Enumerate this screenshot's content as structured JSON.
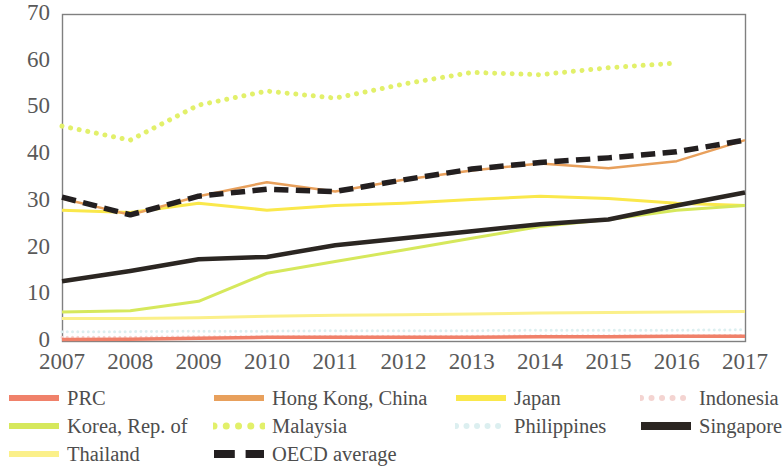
{
  "chart_data": {
    "type": "line",
    "title": "",
    "subtitle": "",
    "xlabel": "",
    "ylabel": "",
    "xlim": [
      2007,
      2017
    ],
    "ylim": [
      0,
      70
    ],
    "grid": false,
    "legend_position": "bottom",
    "x": [
      2007,
      2008,
      2009,
      2010,
      2011,
      2012,
      2013,
      2014,
      2015,
      2016,
      2017
    ],
    "xticks": [
      "2007",
      "2008",
      "2009",
      "2010",
      "2011",
      "2012",
      "2013",
      "2014",
      "2015",
      "2016",
      "2017"
    ],
    "yticks": [
      "0",
      "10",
      "20",
      "30",
      "40",
      "50",
      "60",
      "70"
    ],
    "series": [
      {
        "name": "PRC",
        "color": "#F0816A",
        "style": "solid",
        "width": 3.5,
        "values": [
          0.3,
          0.4,
          0.6,
          0.8,
          0.8,
          0.8,
          0.8,
          0.9,
          0.9,
          1.0,
          1.0
        ]
      },
      {
        "name": "Hong Kong, China",
        "color": "#E8A05C",
        "style": "solid",
        "width": 2.5,
        "values": [
          30.5,
          27.0,
          31.0,
          34.0,
          32.0,
          34.5,
          36.5,
          38.0,
          37.0,
          38.5,
          43.0
        ]
      },
      {
        "name": "Japan",
        "color": "#FAE84B",
        "style": "solid",
        "width": 3,
        "values": [
          28.0,
          27.5,
          29.5,
          28.0,
          29.0,
          29.5,
          30.3,
          31.0,
          30.5,
          29.5,
          29.0
        ]
      },
      {
        "name": "Indonesia",
        "color": "#F4D4D1",
        "style": "dotted",
        "width": 3,
        "values": [
          0.8,
          0.8,
          0.9,
          0.9,
          1.0,
          1.0,
          1.0,
          1.1,
          1.1,
          1.1,
          1.2
        ]
      },
      {
        "name": "Korea, Rep. of",
        "color": "#D6E85C",
        "style": "solid",
        "width": 3,
        "values": [
          6.2,
          6.5,
          8.5,
          14.5,
          17.0,
          19.5,
          22.0,
          24.5,
          26.0,
          28.0,
          29.0
        ]
      },
      {
        "name": "Malaysia",
        "color": "#E2F06A",
        "style": "dotted",
        "width": 5,
        "values": [
          46.0,
          43.0,
          50.5,
          53.5,
          52.0,
          55.0,
          57.5,
          57.0,
          58.5,
          59.5,
          null
        ]
      },
      {
        "name": "Philippines",
        "color": "#DCEFF0",
        "style": "dotted",
        "width": 3,
        "values": [
          2.0,
          2.0,
          2.1,
          2.1,
          2.2,
          2.2,
          2.2,
          2.3,
          2.3,
          2.3,
          2.4
        ]
      },
      {
        "name": "Singapore",
        "color": "#2B2622",
        "style": "solid",
        "width": 4.5,
        "values": [
          12.8,
          15.0,
          17.5,
          18.0,
          20.5,
          22.0,
          23.5,
          25.0,
          26.0,
          29.0,
          31.8
        ]
      },
      {
        "name": "Thailand",
        "color": "#FBF08A",
        "style": "solid",
        "width": 3,
        "values": [
          4.8,
          4.8,
          5.0,
          5.3,
          5.5,
          5.6,
          5.8,
          6.0,
          6.1,
          6.2,
          6.3
        ]
      },
      {
        "name": "OECD average",
        "color": "#231F20",
        "style": "dashed",
        "width": 5.5,
        "values": [
          30.8,
          27.0,
          31.0,
          32.5,
          32.0,
          34.5,
          36.8,
          38.2,
          39.2,
          40.5,
          43.0
        ]
      }
    ]
  },
  "axes": {
    "y_ticks": [
      "70",
      "60",
      "50",
      "40",
      "30",
      "20",
      "10",
      "0"
    ],
    "x_ticks": [
      "2007",
      "2008",
      "2009",
      "2010",
      "2011",
      "2012",
      "2013",
      "2014",
      "2015",
      "2016",
      "2017"
    ],
    "border_color": "#808080"
  },
  "legend": {
    "items": [
      {
        "label": "PRC",
        "color": "#F0816A",
        "style": "solid",
        "width": 6,
        "col": 0,
        "row": 0
      },
      {
        "label": "Hong Kong, China",
        "color": "#E8A05C",
        "style": "solid",
        "width": 6,
        "col": 1,
        "row": 0
      },
      {
        "label": "Japan",
        "color": "#FAE84B",
        "style": "solid",
        "width": 6,
        "col": 2,
        "row": 0
      },
      {
        "label": "Indonesia",
        "color": "#F4D4D1",
        "style": "dotted",
        "width": 6,
        "col": 3,
        "row": 0
      },
      {
        "label": "Korea, Rep. of",
        "color": "#D6E85C",
        "style": "solid",
        "width": 6,
        "col": 0,
        "row": 1
      },
      {
        "label": "Malaysia",
        "color": "#E2F06A",
        "style": "dotted",
        "width": 7,
        "col": 1,
        "row": 1
      },
      {
        "label": "Philippines",
        "color": "#DCEFF0",
        "style": "dotted",
        "width": 6,
        "col": 2,
        "row": 1
      },
      {
        "label": "Singapore",
        "color": "#2B2622",
        "style": "solid",
        "width": 8,
        "col": 3,
        "row": 1
      },
      {
        "label": "Thailand",
        "color": "#FBF08A",
        "style": "solid",
        "width": 6,
        "col": 0,
        "row": 2
      },
      {
        "label": "OECD average",
        "color": "#231F20",
        "style": "dashed",
        "width": 8,
        "col": 1,
        "row": 2
      }
    ]
  }
}
